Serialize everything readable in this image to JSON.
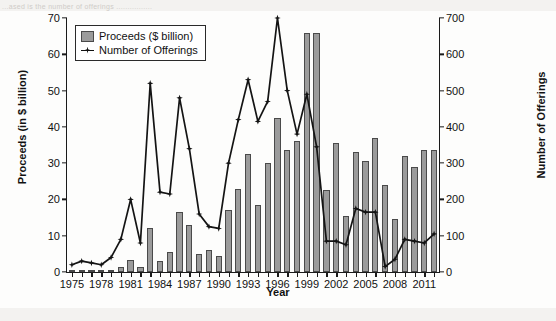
{
  "page": {
    "top_cut_text": "...ased is the number of offerings ................"
  },
  "legend": {
    "position": "top-left",
    "items": [
      {
        "label": "Proceeds ($ billion)",
        "marker": "bar-swatch",
        "color": "#9b9b9b"
      },
      {
        "label": "Number of Offerings",
        "marker": "line-star",
        "color": "#111111"
      }
    ]
  },
  "axes": {
    "x_title": "Year",
    "y_left_title": "Proceeds (in $ billion)",
    "y_right_title": "Number of Offerings",
    "y_left_ticks": [
      0,
      10,
      20,
      30,
      40,
      50,
      60,
      70
    ],
    "y_right_ticks": [
      0,
      100,
      200,
      300,
      400,
      500,
      600,
      700
    ],
    "x_ticklabels": [
      "1975",
      "1978",
      "1981",
      "1984",
      "1987",
      "1990",
      "1993",
      "1996",
      "1999",
      "2002",
      "2005",
      "2008",
      "2011"
    ]
  },
  "chart_data": {
    "type": "bar",
    "title": "",
    "subtitle": "",
    "xlabel": "Year",
    "ylabel": "Proceeds (in $ billion)",
    "ylabel_secondary": "Number of Offerings",
    "ylim": [
      0,
      70
    ],
    "ylim_secondary": [
      0,
      700
    ],
    "grid": false,
    "legend_position": "top-left",
    "categories": [
      "1975",
      "1976",
      "1977",
      "1978",
      "1979",
      "1980",
      "1981",
      "1982",
      "1983",
      "1984",
      "1985",
      "1986",
      "1987",
      "1988",
      "1989",
      "1990",
      "1991",
      "1992",
      "1993",
      "1994",
      "1995",
      "1996",
      "1997",
      "1998",
      "1999",
      "2000",
      "2001",
      "2002",
      "2003",
      "2004",
      "2005",
      "2006",
      "2007",
      "2008",
      "2009",
      "2010",
      "2011",
      "2012"
    ],
    "series": [
      {
        "name": "Proceeds ($ billion)",
        "type": "bar",
        "axis": "left",
        "unit": "$ billion",
        "values": [
          0.2,
          0.3,
          0.2,
          0.3,
          0.5,
          1.4,
          3.2,
          1.5,
          12.0,
          3.0,
          5.5,
          16.5,
          13.0,
          5.0,
          6.0,
          4.5,
          17.0,
          23.0,
          32.5,
          18.5,
          30.0,
          42.5,
          33.5,
          36.0,
          66.0,
          66.0,
          22.5,
          35.5,
          15.5,
          33.0,
          30.5,
          37.0,
          24.0,
          14.5,
          32.0,
          29.0,
          33.5,
          33.5
        ]
      },
      {
        "name": "Number of Offerings",
        "type": "line",
        "axis": "right",
        "unit": "offerings",
        "values": [
          20,
          30,
          25,
          20,
          40,
          90,
          200,
          80,
          520,
          220,
          215,
          480,
          340,
          160,
          125,
          120,
          300,
          420,
          530,
          415,
          470,
          700,
          500,
          380,
          490,
          345,
          85,
          85,
          75,
          175,
          165,
          165,
          15,
          35,
          90,
          85,
          80,
          105
        ]
      }
    ]
  }
}
